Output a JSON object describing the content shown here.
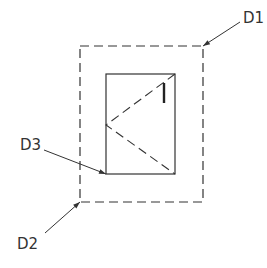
{
  "diagram": {
    "type": "technical-drawing",
    "stroke_color": "#333333",
    "background": "#ffffff",
    "labels": {
      "d1": "D1",
      "d2": "D2",
      "d3": "D3"
    },
    "elements": {
      "outer_boundary": {
        "style": "dashed",
        "x": 80,
        "y": 46,
        "width": 123,
        "height": 156
      },
      "inner_rectangle": {
        "style": "solid",
        "x": 106,
        "y": 74,
        "width": 69,
        "height": 100
      },
      "diagonal_lines": {
        "style": "dashed",
        "points": [
          [
            175,
            74
          ],
          [
            106,
            125
          ],
          [
            175,
            174
          ]
        ]
      },
      "marker_line": {
        "style": "solid-thick",
        "x": 164,
        "y1": 83,
        "y2": 103
      }
    },
    "leaders": [
      {
        "label": "D1",
        "from": [
          240,
          22
        ],
        "to": [
          203,
          46
        ]
      },
      {
        "label": "D3",
        "from": [
          44,
          150
        ],
        "to": [
          106,
          174
        ]
      },
      {
        "label": "D2",
        "from": [
          45,
          233
        ],
        "to": [
          80,
          202
        ]
      }
    ]
  }
}
